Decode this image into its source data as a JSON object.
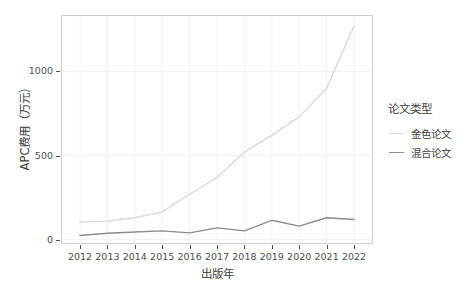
{
  "chart_data": {
    "type": "line",
    "title": "",
    "xlabel": "出版年",
    "ylabel": "APC费用（万元）",
    "x": [
      2012,
      2013,
      2014,
      2015,
      2016,
      2017,
      2018,
      2019,
      2020,
      2021,
      2022
    ],
    "categories": [
      "2012",
      "2013",
      "2014",
      "2015",
      "2016",
      "2017",
      "2018",
      "2019",
      "2020",
      "2021",
      "2022"
    ],
    "series": [
      {
        "name": "金色论文",
        "color": "#d9d9d9",
        "values": [
          105,
          110,
          130,
          165,
          270,
          370,
          520,
          620,
          730,
          900,
          1270
        ]
      },
      {
        "name": "混合论文",
        "color": "#8c8c8c",
        "values": [
          25,
          38,
          45,
          52,
          40,
          70,
          52,
          115,
          80,
          130,
          120
        ]
      }
    ],
    "xlim": [
      2012,
      2022
    ],
    "ylim": [
      -20,
      1330
    ],
    "y_ticks": [
      0,
      500,
      1000
    ],
    "y_tick_labels": [
      "0",
      "500",
      "1000"
    ],
    "x_ticks": [
      2012,
      2013,
      2014,
      2015,
      2016,
      2017,
      2018,
      2019,
      2020,
      2021,
      2022
    ],
    "grid": true,
    "grid_color": "#f2f2f2",
    "panel_background": "#ffffff",
    "panel_border_color": "#cfcfcf",
    "legend_position": "right",
    "legend": {
      "title": "论文类型",
      "entries": [
        {
          "label": "金色论文",
          "color": "#d9d9d9"
        },
        {
          "label": "混合论文",
          "color": "#8c8c8c"
        }
      ]
    }
  }
}
